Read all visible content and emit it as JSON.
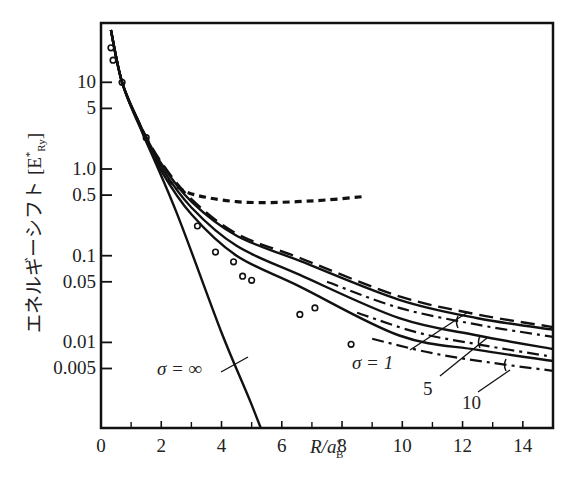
{
  "chart_data": {
    "type": "line",
    "title": "",
    "xlabel": "R/a*_B",
    "ylabel": "エネルギーシフト [E*_Ry]",
    "xlim": [
      0,
      15
    ],
    "ylim": [
      0.002,
      40
    ],
    "yscale": "log",
    "grid": false,
    "x_ticks": [
      0,
      2,
      4,
      6,
      8,
      10,
      12,
      14
    ],
    "x_minor_ticks": [
      1,
      3,
      5,
      7,
      9,
      11,
      13
    ],
    "y_ticks": [
      {
        "value": 10,
        "label": "10"
      },
      {
        "value": 5,
        "label": "5"
      },
      {
        "value": 1.0,
        "label": "1.0"
      },
      {
        "value": 0.5,
        "label": "0.5"
      },
      {
        "value": 0.1,
        "label": "0.1"
      },
      {
        "value": 0.05,
        "label": "0.05"
      },
      {
        "value": 0.01,
        "label": "0.01"
      },
      {
        "value": 0.005,
        "label": "0.005"
      }
    ],
    "series": [
      {
        "name": "σ = ∞",
        "style": "solid",
        "x": [
          0.33,
          0.7,
          1.3,
          1.4,
          2.5,
          4.0,
          5.0,
          6.1
        ],
        "y": [
          40,
          10,
          3.2,
          2.5,
          0.32,
          0.013,
          0.0019,
          0.0002
        ]
      },
      {
        "name": "short-dashed",
        "style": "dotted",
        "x": [
          2.2,
          2.8,
          3.5,
          4.5,
          5.5,
          6.5,
          7.5,
          8.7
        ],
        "y": [
          0.75,
          0.55,
          0.47,
          0.42,
          0.41,
          0.42,
          0.44,
          0.48
        ]
      },
      {
        "name": "long-dashed",
        "style": "dashed",
        "x": [
          0.33,
          0.7,
          1.3,
          2.0,
          3.0,
          4.5,
          6.6,
          9.9,
          12.5,
          15.0
        ],
        "y": [
          40,
          10,
          3.2,
          1.2,
          0.45,
          0.18,
          0.094,
          0.034,
          0.021,
          0.015
        ]
      },
      {
        "name": "σ = 1",
        "style": "solid",
        "x": [
          0.33,
          0.7,
          1.3,
          2.0,
          3.0,
          4.5,
          6.6,
          9.9,
          12.5,
          15.0
        ],
        "y": [
          40,
          10,
          3.2,
          1.15,
          0.42,
          0.17,
          0.087,
          0.031,
          0.019,
          0.014
        ]
      },
      {
        "name": "σ = 1 (dash-dot)",
        "style": "dashdot",
        "x": [
          7.5,
          9.9,
          12.5,
          15.0
        ],
        "y": [
          0.05,
          0.025,
          0.016,
          0.0116
        ]
      },
      {
        "name": "σ = 5",
        "style": "solid",
        "x": [
          0.33,
          0.7,
          1.3,
          2.0,
          3.0,
          4.5,
          6.6,
          9.9,
          12.5,
          15.0
        ],
        "y": [
          40,
          10,
          3.1,
          1.05,
          0.36,
          0.13,
          0.06,
          0.019,
          0.012,
          0.0084
        ]
      },
      {
        "name": "σ = 5 (dash-dot)",
        "style": "dashdot",
        "x": [
          8.5,
          10.5,
          12.5,
          15.0
        ],
        "y": [
          0.022,
          0.013,
          0.0095,
          0.0068
        ]
      },
      {
        "name": "σ = 10",
        "style": "solid",
        "x": [
          0.33,
          0.7,
          1.3,
          2.0,
          3.0,
          4.5,
          6.6,
          9.9,
          12.5,
          15.0
        ],
        "y": [
          40,
          10,
          3.0,
          0.95,
          0.3,
          0.1,
          0.044,
          0.012,
          0.0082,
          0.0061
        ]
      },
      {
        "name": "σ = 10 (dash-dot)",
        "style": "dashdot",
        "x": [
          9.0,
          11.0,
          13.0,
          15.0
        ],
        "y": [
          0.011,
          0.0075,
          0.0058,
          0.0047
        ]
      },
      {
        "name": "experimental",
        "style": "markers",
        "x": [
          0.33,
          0.4,
          0.7,
          1.5,
          3.2,
          3.8,
          4.4,
          4.7,
          5.0,
          6.6,
          7.1,
          8.3
        ],
        "y": [
          25,
          18,
          10,
          2.3,
          0.22,
          0.11,
          0.085,
          0.058,
          0.052,
          0.021,
          0.025,
          0.0095
        ]
      }
    ],
    "annotations": [
      {
        "text": "σ = ∞",
        "x": 2.1,
        "y": 0.0042
      },
      {
        "text": "σ = 1",
        "x": 8.3,
        "y": 0.0055
      },
      {
        "text": "5",
        "x": 10.0,
        "y": 0.0022
      },
      {
        "text": "10",
        "x": 11.6,
        "y": 0.0014
      }
    ]
  },
  "labels": {
    "y_label_text": "エネルギーシフト ",
    "y_unit_open": "[E",
    "y_unit_sup": "*",
    "y_unit_sub": "Ry",
    "y_unit_close": "]",
    "x_label_main": "R/a",
    "x_label_sup": "*",
    "x_label_sub": "B",
    "sigma_inf": "σ = ∞",
    "sigma_1": "σ = 1",
    "sigma_5": "5",
    "sigma_10": "10"
  }
}
